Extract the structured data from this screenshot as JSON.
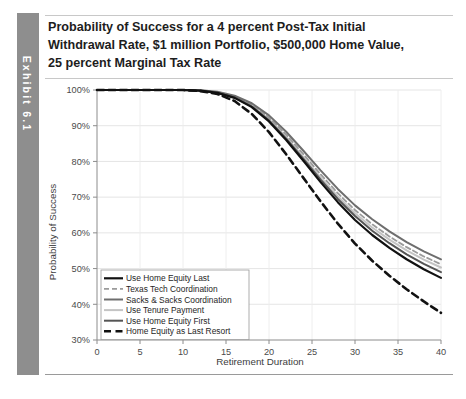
{
  "exhibit": {
    "tab_label": "Exhibit 6.1"
  },
  "title": {
    "line1": "Probability of Success for a 4 percent Post-Tax Initial",
    "line2": "Withdrawal Rate, $1 million Portfolio, $500,000 Home Value,",
    "line3": "25 percent Marginal Tax Rate"
  },
  "chart_data": {
    "type": "line",
    "title": "Probability of Success for a 4 percent Post-Tax Initial Withdrawal Rate, $1 million Portfolio, $500,000 Home Value, 25 percent Marginal Tax Rate",
    "xlabel": "Retirement Duration",
    "ylabel": "Probability of Success",
    "xlim": [
      0,
      40
    ],
    "ylim": [
      30,
      100
    ],
    "xticks": [
      0,
      5,
      10,
      15,
      20,
      25,
      30,
      35,
      40
    ],
    "xtick_labels": [
      "0",
      "5",
      "10",
      "15",
      "20",
      "25",
      "30",
      "35",
      "40"
    ],
    "yticks": [
      30,
      40,
      50,
      60,
      70,
      80,
      90,
      100
    ],
    "ytick_labels": [
      "30%",
      "40%",
      "50%",
      "60%",
      "70%",
      "80%",
      "90%",
      "100%"
    ],
    "grid": true,
    "legend_position": "lower-left",
    "x": [
      0,
      2,
      4,
      6,
      8,
      10,
      12,
      14,
      16,
      18,
      20,
      22,
      24,
      26,
      28,
      30,
      32,
      34,
      36,
      38,
      40
    ],
    "series": [
      {
        "name": "Use Home Equity Last",
        "color": "#111111",
        "style": "solid",
        "width": 2.2,
        "values": [
          100,
          100,
          100,
          100,
          100,
          100,
          99.8,
          99.2,
          97.8,
          95.2,
          91.2,
          86.0,
          80.2,
          74.2,
          68.6,
          63.6,
          59.4,
          55.8,
          52.6,
          49.8,
          47.4
        ]
      },
      {
        "name": "Texas Tech Coordination",
        "color": "#9b9b9b",
        "style": "dashed",
        "width": 1.8,
        "values": [
          100,
          100,
          100,
          100,
          100,
          100,
          99.9,
          99.4,
          98.2,
          95.9,
          92.3,
          87.5,
          82.0,
          76.4,
          71.1,
          66.4,
          62.4,
          59.0,
          56.0,
          53.4,
          51.2
        ]
      },
      {
        "name": "Sacks & Sacks Coordination",
        "color": "#6e6e6e",
        "style": "solid",
        "width": 2.0,
        "values": [
          100,
          100,
          100,
          100,
          100,
          100,
          99.9,
          99.5,
          98.4,
          96.3,
          92.9,
          88.3,
          83.0,
          77.5,
          72.3,
          67.7,
          63.8,
          60.4,
          57.4,
          54.8,
          52.6
        ]
      },
      {
        "name": "Use Tenure Payment",
        "color": "#c4c4c4",
        "style": "solid",
        "width": 2.0,
        "values": [
          100,
          100,
          100,
          100,
          100,
          100,
          99.8,
          99.3,
          98.0,
          95.6,
          91.8,
          86.8,
          81.2,
          75.5,
          70.2,
          65.5,
          61.5,
          58.1,
          55.1,
          52.5,
          50.3
        ]
      },
      {
        "name": "Use Home Equity First",
        "color": "#555555",
        "style": "solid",
        "width": 2.0,
        "values": [
          100,
          100,
          100,
          100,
          100,
          100,
          99.8,
          99.2,
          97.9,
          95.4,
          91.5,
          86.4,
          80.7,
          74.9,
          69.5,
          64.7,
          60.6,
          57.1,
          54.0,
          51.3,
          49.0
        ]
      },
      {
        "name": "Home Equity as Last Resort",
        "color": "#111111",
        "style": "heavy-dashed",
        "width": 2.6,
        "values": [
          100,
          100,
          100,
          100,
          100,
          100,
          99.7,
          98.9,
          96.9,
          93.3,
          88.2,
          82.0,
          75.4,
          68.8,
          62.6,
          57.0,
          52.2,
          48.0,
          44.2,
          40.8,
          37.6
        ]
      }
    ]
  }
}
